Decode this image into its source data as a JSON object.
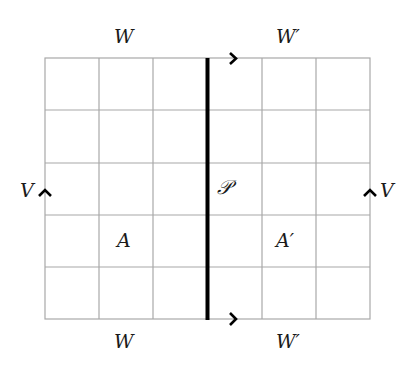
{
  "diagram": {
    "type": "grid-with-gluing",
    "grid": {
      "columns": 6,
      "rows": 5,
      "line_color": "#a0a0a0"
    },
    "divider": {
      "label": "𝒫",
      "color": "#000000",
      "position_after_column": 3
    },
    "labels": {
      "top_left": "W",
      "top_right": "W′",
      "bottom_left": "W",
      "bottom_right": "W′",
      "left": "V",
      "right": "V",
      "region_left": "A",
      "region_right": "A′",
      "divider": "𝒫"
    },
    "arrows": [
      {
        "position": "top",
        "direction": "right"
      },
      {
        "position": "bottom",
        "direction": "right"
      },
      {
        "position": "left",
        "direction": "up"
      },
      {
        "position": "right",
        "direction": "up"
      }
    ]
  }
}
